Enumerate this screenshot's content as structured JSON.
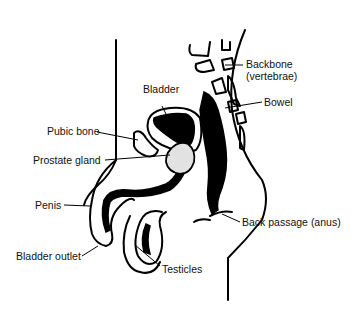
{
  "diagram": {
    "labels": {
      "backbone": "Backbone",
      "backbone_sub": "(vertebrae)",
      "bowel": "Bowel",
      "bladder": "Bladder",
      "pubic_bone": "Pubic bone",
      "prostate": "Prostate gland",
      "penis": "Penis",
      "bladder_outlet": "Bladder outlet",
      "testicles": "Testicles",
      "anus": "Back passage (anus)"
    },
    "colors": {
      "line": "#000000",
      "prostate_fill": "#e2e2e2",
      "background": "#ffffff"
    }
  }
}
